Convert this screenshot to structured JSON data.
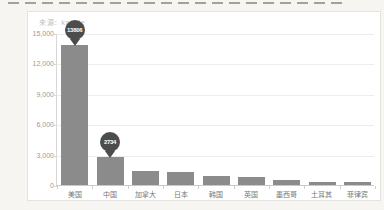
{
  "page": {
    "source_label": "来源：kaggle"
  },
  "chart_data": {
    "type": "bar",
    "title": "",
    "xlabel": "",
    "ylabel": "",
    "categories": [
      "美国",
      "中国",
      "加拿大",
      "日本",
      "韩国",
      "英国",
      "墨西哥",
      "土耳其",
      "菲律宾"
    ],
    "values": [
      13806,
      2734,
      1400,
      1250,
      850,
      750,
      480,
      330,
      290
    ],
    "annotations": [
      {
        "category": "美国",
        "label": "13806"
      },
      {
        "category": "中国",
        "label": "2734"
      }
    ],
    "ylim": [
      0,
      15000
    ],
    "yticks": [
      "15,000",
      "12,000",
      "9,000",
      "6,000",
      "3,000",
      "0"
    ],
    "grid": true,
    "legend": "none",
    "bar_color": "#8b8b8b",
    "pin_color": "#4c4c4c",
    "pin_text_color": "#ffffff"
  }
}
